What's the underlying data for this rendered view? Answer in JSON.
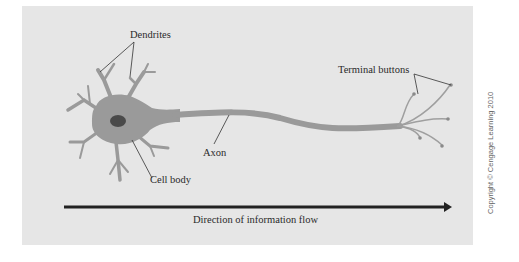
{
  "diagram": {
    "labels": {
      "dendrites": "Dendrites",
      "terminal_buttons": "Terminal buttons",
      "axon": "Axon",
      "cell_body": "Cell body"
    },
    "flow_arrow": {
      "caption": "Direction of information flow",
      "direction": "left-to-right"
    },
    "copyright": "Copyright © Cengage Learning 2010",
    "colors": {
      "background": "#ffffff",
      "panel": "#e6e6e6",
      "neuron": "#9a9a9a",
      "nucleus": "#4a4a4a",
      "leader_line": "#333333",
      "arrow": "#222222",
      "text": "#2a2a2a"
    }
  }
}
